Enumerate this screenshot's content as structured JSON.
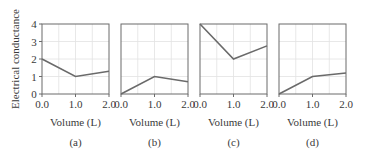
{
  "chart_data": [
    {
      "type": "line",
      "panel_label": "(a)",
      "xlabel": "Volume (L)",
      "ylabel": "Electrical conductance",
      "x": [
        0.0,
        1.0,
        2.0
      ],
      "values": [
        2.0,
        1.0,
        1.3
      ],
      "x_ticks": [
        "0.0",
        "1.0",
        "2.0"
      ],
      "y_ticks": [
        "0",
        "1",
        "2",
        "3",
        "4"
      ],
      "xlim": [
        0,
        2
      ],
      "ylim": [
        0,
        4
      ],
      "grid": true
    },
    {
      "type": "line",
      "panel_label": "(b)",
      "xlabel": "Volume (L)",
      "x": [
        0.0,
        1.0,
        2.0
      ],
      "values": [
        0.0,
        1.0,
        0.7
      ],
      "x_ticks": [
        "0.0",
        "1.0",
        "2.0"
      ],
      "xlim": [
        0,
        2
      ],
      "ylim": [
        0,
        4
      ],
      "grid": true
    },
    {
      "type": "line",
      "panel_label": "(c)",
      "xlabel": "Volume (L)",
      "x": [
        0.0,
        1.0,
        2.0
      ],
      "values": [
        4.0,
        2.0,
        2.75
      ],
      "x_ticks": [
        "0.0",
        "1.0",
        "2.0"
      ],
      "xlim": [
        0,
        2
      ],
      "ylim": [
        0,
        4
      ],
      "grid": true
    },
    {
      "type": "line",
      "panel_label": "(d)",
      "xlabel": "Volume (L)",
      "x": [
        0.0,
        1.0,
        2.0
      ],
      "values": [
        0.0,
        1.0,
        1.2
      ],
      "x_ticks": [
        "0.0",
        "1.0",
        "2.0"
      ],
      "xlim": [
        0,
        2
      ],
      "ylim": [
        0,
        4
      ],
      "grid": true
    }
  ],
  "labels": {
    "ylabel": "Electrical conductance",
    "y_ticks": [
      "0",
      "1",
      "2",
      "3",
      "4"
    ],
    "panels": [
      {
        "x_ticks": [
          "0.0",
          "1.0",
          "2.0"
        ],
        "xlabel": "Volume (L)",
        "caption": "(a)"
      },
      {
        "x_ticks": [
          "0.0",
          "1.0",
          "2.0"
        ],
        "xlabel": "Volume (L)",
        "caption": "(b)"
      },
      {
        "x_ticks": [
          "0.0",
          "1.0",
          "2.0"
        ],
        "xlabel": "Volume (L)",
        "caption": "(c)"
      },
      {
        "x_ticks": [
          "0.0",
          "1.0",
          "2.0"
        ],
        "xlabel": "Volume (L)",
        "caption": "(d)"
      }
    ]
  },
  "colors": {
    "line": "#6a6a6a",
    "frame": "#6b6b6b",
    "grid": "#e2e2e2",
    "text": "#3a3a3a"
  }
}
